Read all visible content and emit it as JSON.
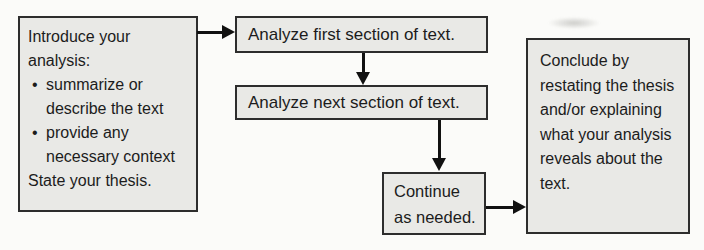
{
  "colors": {
    "background": "#fbfbf9",
    "box_fill": "#e9e9e6",
    "box_border": "#2d2d2d",
    "text": "#1c1c1c",
    "arrow": "#111111"
  },
  "nodes": {
    "intro": {
      "heading": "Introduce your analysis:",
      "bullet_char": "•",
      "bullets": [
        "summarize or describe the text",
        "provide any necessary context"
      ],
      "footer": "State your thesis."
    },
    "analyze_first": {
      "label": "Analyze first section of text."
    },
    "analyze_next": {
      "label": "Analyze next section of text."
    },
    "continue_step": {
      "label": "Continue as needed."
    },
    "conclude": {
      "label": "Conclude by restating the thesis and/or explaining what your analysis reveals about the text."
    }
  }
}
